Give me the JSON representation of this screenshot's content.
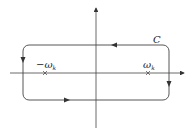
{
  "diagram": {
    "type": "complex-plane-contour",
    "contour_label": "C",
    "poles": [
      {
        "label": "−ω",
        "subscript": "k",
        "x": 45
      },
      {
        "label": "ω",
        "subscript": "k",
        "x": 148
      }
    ],
    "axes": {
      "horizontal": "real",
      "vertical": "imaginary"
    },
    "contour_direction": "counterclockwise-as-drawn",
    "colors": {
      "stroke": "#333333",
      "background": "#ffffff"
    }
  }
}
